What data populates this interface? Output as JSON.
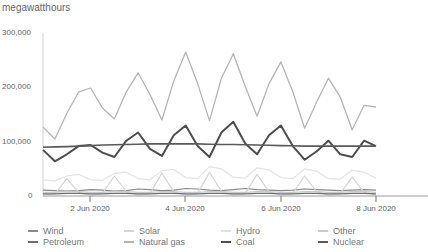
{
  "chart_data": {
    "type": "line",
    "title": "",
    "ylabel": "megawatthours",
    "xlabel": "",
    "ylim": [
      0,
      300000
    ],
    "yticks": [
      0,
      100000,
      200000,
      300000
    ],
    "ytick_labels": [
      "0",
      "100,000",
      "200,000",
      "300,000"
    ],
    "xticks": [
      "2 Jun 2020",
      "4 Jun 2020",
      "6 Jun 2020",
      "8 Jun 2020"
    ],
    "x_start": "1 Jun 2020 (approx)",
    "x_end": "8 Jun 2020",
    "sampling": "every 6 hours, from ~1 Jun 2020 00:00 to 8 Jun 2020 00:00",
    "grid": false,
    "legend_position": "bottom",
    "series": [
      {
        "name": "Wind",
        "color": "#8a8a8a",
        "values": [
          9000,
          8000,
          7000,
          8000,
          10000,
          9000,
          7000,
          8000,
          11000,
          10000,
          8000,
          9000,
          12000,
          11000,
          9000,
          8000,
          10000,
          12000,
          10000,
          9000,
          8000,
          9000,
          11000,
          10000,
          9000,
          8000,
          9000,
          10000,
          9000
        ]
      },
      {
        "name": "Solar",
        "color": "#d6d6d6",
        "values": [
          0,
          2000,
          30000,
          5000,
          0,
          3000,
          35000,
          6000,
          0,
          3000,
          40000,
          6000,
          0,
          3000,
          42000,
          7000,
          0,
          3000,
          38000,
          6000,
          0,
          3000,
          35000,
          6000,
          0,
          3000,
          33000,
          5000,
          0
        ]
      },
      {
        "name": "Hydro",
        "color": "#e3e3e3",
        "values": [
          28000,
          26000,
          35000,
          38000,
          28000,
          27000,
          40000,
          42000,
          30000,
          28000,
          45000,
          47000,
          32000,
          30000,
          52000,
          48000,
          33000,
          31000,
          50000,
          46000,
          32000,
          30000,
          48000,
          44000,
          30000,
          29000,
          46000,
          42000,
          31000
        ]
      },
      {
        "name": "Other",
        "color": "#c9c9c9",
        "values": [
          5000,
          5000,
          6000,
          6000,
          5000,
          5000,
          6000,
          6000,
          5000,
          5000,
          6000,
          6000,
          5000,
          5000,
          6000,
          6000,
          5000,
          5000,
          6000,
          6000,
          5000,
          5000,
          6000,
          6000,
          5000,
          5000,
          6000,
          6000,
          5000
        ]
      },
      {
        "name": "Petroleum",
        "color": "#6e6e6e",
        "values": [
          2000,
          2000,
          3000,
          3000,
          2000,
          2000,
          3000,
          3000,
          2000,
          2000,
          3000,
          3000,
          2000,
          2000,
          3000,
          3000,
          2000,
          2000,
          3000,
          3000,
          2000,
          2000,
          3000,
          3000,
          2000,
          2000,
          3000,
          3000,
          2000
        ]
      },
      {
        "name": "Natural gas",
        "color": "#b5b5b5",
        "values": [
          125000,
          103000,
          150000,
          190000,
          197000,
          160000,
          140000,
          190000,
          225000,
          185000,
          138000,
          210000,
          263000,
          205000,
          137000,
          215000,
          260000,
          200000,
          145000,
          205000,
          245000,
          190000,
          123000,
          170000,
          215000,
          180000,
          120000,
          165000,
          162000
        ]
      },
      {
        "name": "Coal",
        "color": "#4d4d4d",
        "values": [
          83000,
          62000,
          75000,
          90000,
          92000,
          78000,
          70000,
          100000,
          115000,
          85000,
          72000,
          110000,
          128000,
          90000,
          70000,
          115000,
          135000,
          95000,
          75000,
          110000,
          128000,
          90000,
          65000,
          80000,
          100000,
          75000,
          70000,
          100000,
          90000
        ]
      },
      {
        "name": "Nuclear",
        "color": "#5a5a5a",
        "values": [
          88000,
          88500,
          89000,
          90000,
          91000,
          92000,
          92500,
          93000,
          93500,
          94000,
          94000,
          94000,
          94000,
          94000,
          93500,
          93000,
          93000,
          92500,
          92000,
          91500,
          91000,
          90500,
          90000,
          90000,
          90000,
          90000,
          90000,
          90000,
          90000
        ]
      }
    ]
  },
  "axis": {
    "unit_label": "megawatthours",
    "y_labels": [
      "300,000",
      "200,000",
      "100,000",
      "0"
    ],
    "x_labels": [
      "2 Jun 2020",
      "4 Jun 2020",
      "6 Jun 2020",
      "8 Jun 2020"
    ]
  },
  "legend": {
    "items": [
      {
        "label": "Wind",
        "color": "#8a8a8a"
      },
      {
        "label": "Solar",
        "color": "#d6d6d6"
      },
      {
        "label": "Hydro",
        "color": "#e3e3e3"
      },
      {
        "label": "Other",
        "color": "#c9c9c9"
      },
      {
        "label": "Petroleum",
        "color": "#6e6e6e"
      },
      {
        "label": "Natural gas",
        "color": "#b5b5b5"
      },
      {
        "label": "Coal",
        "color": "#4d4d4d"
      },
      {
        "label": "Nuclear",
        "color": "#5a5a5a"
      }
    ]
  }
}
